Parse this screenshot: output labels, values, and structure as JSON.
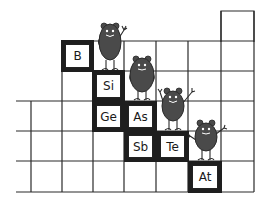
{
  "illustration": {
    "subject": "periodic table staircase of metalloids with cartoon creatures",
    "colors": {
      "line": "#2a2a2a",
      "box_border": "#1e1e1e",
      "creature": "#4a4a4a",
      "background": "#ffffff"
    },
    "elements": [
      {
        "symbol": "B",
        "left": 62,
        "top": 41
      },
      {
        "symbol": "Si",
        "left": 93,
        "top": 71
      },
      {
        "symbol": "Ge",
        "left": 93,
        "top": 101
      },
      {
        "symbol": "As",
        "left": 124,
        "top": 101
      },
      {
        "symbol": "Sb",
        "left": 124,
        "top": 131
      },
      {
        "symbol": "Te",
        "left": 156,
        "top": 131
      },
      {
        "symbol": "At",
        "left": 188,
        "top": 161
      }
    ],
    "creatures": [
      {
        "name": "creature-on-si",
        "pose": "waving"
      },
      {
        "name": "creature-on-as",
        "pose": "hands-on-hips"
      },
      {
        "name": "creature-on-te",
        "pose": "both-arms-up"
      },
      {
        "name": "creature-on-at",
        "pose": "arms-out"
      }
    ]
  }
}
